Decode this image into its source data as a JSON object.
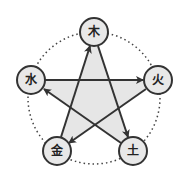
{
  "diagram": {
    "nodes": [
      {
        "id": "wood",
        "label": "木",
        "x": 94,
        "y": 32
      },
      {
        "id": "fire",
        "label": "火",
        "x": 158,
        "y": 80
      },
      {
        "id": "earth",
        "label": "土",
        "x": 133,
        "y": 151
      },
      {
        "id": "metal",
        "label": "金",
        "x": 57,
        "y": 151
      },
      {
        "id": "water",
        "label": "水",
        "x": 31,
        "y": 80
      }
    ],
    "arrows": [
      {
        "from": "wood",
        "to": "earth"
      },
      {
        "from": "earth",
        "to": "water"
      },
      {
        "from": "water",
        "to": "fire"
      },
      {
        "from": "fire",
        "to": "metal"
      },
      {
        "from": "metal",
        "to": "wood"
      }
    ],
    "colors": {
      "node_fill": "#e8e8e8",
      "stroke": "#333333",
      "star_fill": "#e6e6e6",
      "dotted": "#444444"
    }
  }
}
